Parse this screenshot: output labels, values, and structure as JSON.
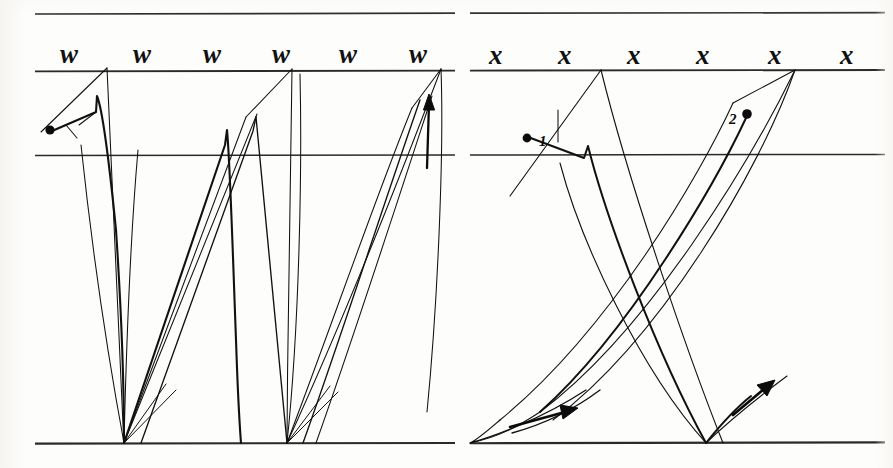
{
  "page": {
    "title": "Italic handwriting stroke-construction guide",
    "background_color": "#fdfdfc",
    "ink_color": "#111111",
    "width": 893,
    "height": 468
  },
  "guidelines": {
    "color": "#2a2a2a",
    "rows": [
      {
        "name": "ascender-line",
        "y": 14
      },
      {
        "name": "waist-line",
        "y": 71
      },
      {
        "name": "x-midline",
        "y": 155
      },
      {
        "name": "base-line",
        "y": 443
      }
    ]
  },
  "panels": [
    {
      "id": "panel-w",
      "letter": "w",
      "letter_label": "w",
      "heading_letters": [
        "w",
        "w",
        "w",
        "w",
        "w",
        "w"
      ],
      "letter_x_positions": [
        60,
        133,
        203,
        272,
        339,
        409
      ],
      "letter_baseline_y": 68,
      "stroke_count": 1,
      "stroke_markers": [
        {
          "number": "",
          "dot_x": 50,
          "dot_y": 130,
          "label_x": 0,
          "label_y": 0,
          "show_label": false
        }
      ],
      "arrows": [
        {
          "name": "exit-arrow-up",
          "x": 429,
          "y": 98,
          "direction": "up"
        }
      ]
    },
    {
      "id": "panel-x",
      "letter": "x",
      "letter_label": "x",
      "heading_letters": [
        "x",
        "x",
        "x",
        "x",
        "x",
        "x"
      ],
      "letter_x_positions": [
        489,
        558,
        627,
        696,
        768,
        840
      ],
      "letter_baseline_y": 68,
      "stroke_count": 2,
      "stroke_markers": [
        {
          "number": "1",
          "dot_x": 527,
          "dot_y": 138,
          "label_x": 539,
          "label_y": 134,
          "show_label": true
        },
        {
          "number": "2",
          "dot_x": 747,
          "dot_y": 114,
          "label_x": 729,
          "label_y": 113,
          "show_label": true
        }
      ],
      "arrows": [
        {
          "name": "stroke-1-exit-arrow",
          "x": 560,
          "y": 408,
          "direction": "right-up"
        },
        {
          "name": "stroke-2-exit-arrow",
          "x": 765,
          "y": 385,
          "direction": "right-up"
        }
      ]
    }
  ],
  "divider": {
    "name": "panel-divider",
    "x": 462,
    "visible": false
  }
}
